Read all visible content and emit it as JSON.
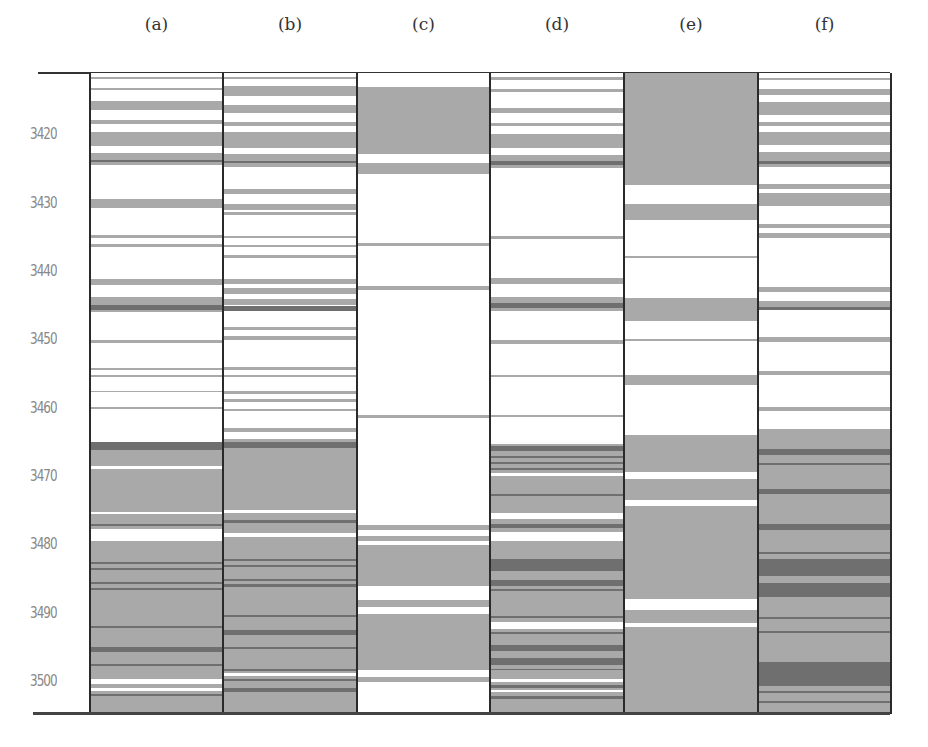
{
  "chart_data": {
    "type": "heatmap",
    "title": "",
    "xlabel": "",
    "ylabel": "",
    "y_axis": {
      "ticks": [
        3420,
        3430,
        3440,
        3450,
        3460,
        3470,
        3480,
        3490,
        3500
      ],
      "range": [
        3410.9,
        3504.5
      ],
      "inverted": true
    },
    "grid": false,
    "legend": null,
    "colors": {
      "background": "#ffffff",
      "light": "#a9a9a9",
      "dark": "#6f6f6f",
      "frame": "#2a2a2a"
    },
    "note": "Each column is a vertical strip log; bands give [top_depth, bottom_depth, tone]. Bands are drawn in order; later bands paint over earlier ones.",
    "columns": [
      {
        "label": "(a)",
        "bands": [
          [
            3411.5,
            3411.8,
            "light"
          ],
          [
            3413.1,
            3413.4,
            "light"
          ],
          [
            3415.0,
            3416.3,
            "light"
          ],
          [
            3417.8,
            3418.4,
            "light"
          ],
          [
            3419.6,
            3421.6,
            "light"
          ],
          [
            3422.6,
            3424.4,
            "light"
          ],
          [
            3423.6,
            3423.9,
            "dark"
          ],
          [
            3429.4,
            3430.6,
            "light"
          ],
          [
            3434.6,
            3435.0,
            "light"
          ],
          [
            3435.9,
            3436.3,
            "light"
          ],
          [
            3441.0,
            3441.9,
            "light"
          ],
          [
            3443.7,
            3444.8,
            "light"
          ],
          [
            3444.8,
            3445.5,
            "dark"
          ],
          [
            3445.5,
            3445.8,
            "light"
          ],
          [
            3449.9,
            3450.4,
            "light"
          ],
          [
            3454.0,
            3454.3,
            "light"
          ],
          [
            3455.1,
            3455.4,
            "light"
          ],
          [
            3457.4,
            3457.6,
            "light"
          ],
          [
            3459.8,
            3460.1,
            "light"
          ],
          [
            3464.8,
            3504.5,
            "light"
          ],
          [
            3464.8,
            3466.0,
            "dark"
          ],
          [
            3468.4,
            3468.8,
            "white"
          ],
          [
            3475.1,
            3475.4,
            "white"
          ],
          [
            3476.8,
            3477.1,
            "dark"
          ],
          [
            3477.6,
            3479.3,
            "white"
          ],
          [
            3482.4,
            3482.7,
            "dark"
          ],
          [
            3483.3,
            3483.6,
            "dark"
          ],
          [
            3485.3,
            3485.6,
            "dark"
          ],
          [
            3486.2,
            3486.5,
            "dark"
          ],
          [
            3491.8,
            3492.1,
            "dark"
          ],
          [
            3494.9,
            3495.6,
            "dark"
          ],
          [
            3497.3,
            3497.6,
            "dark"
          ],
          [
            3499.5,
            3500.2,
            "white"
          ],
          [
            3500.8,
            3501.3,
            "white"
          ],
          [
            3501.7,
            3502.0,
            "dark"
          ]
        ]
      },
      {
        "label": "(b)",
        "bands": [
          [
            3411.5,
            3411.8,
            "light"
          ],
          [
            3412.8,
            3414.3,
            "light"
          ],
          [
            3415.6,
            3416.8,
            "light"
          ],
          [
            3418.1,
            3418.6,
            "light"
          ],
          [
            3419.5,
            3421.8,
            "light"
          ],
          [
            3422.8,
            3424.6,
            "light"
          ],
          [
            3423.7,
            3424.1,
            "dark"
          ],
          [
            3427.8,
            3428.6,
            "light"
          ],
          [
            3430.0,
            3430.9,
            "light"
          ],
          [
            3431.3,
            3431.6,
            "light"
          ],
          [
            3434.7,
            3435.0,
            "light"
          ],
          [
            3436.0,
            3436.4,
            "light"
          ],
          [
            3437.5,
            3437.9,
            "light"
          ],
          [
            3441.0,
            3441.8,
            "light"
          ],
          [
            3442.3,
            3443.2,
            "light"
          ],
          [
            3443.9,
            3444.9,
            "light"
          ],
          [
            3445.0,
            3445.7,
            "dark"
          ],
          [
            3448.0,
            3448.5,
            "light"
          ],
          [
            3449.3,
            3450.0,
            "light"
          ],
          [
            3453.9,
            3454.3,
            "light"
          ],
          [
            3455.0,
            3455.4,
            "light"
          ],
          [
            3457.4,
            3457.8,
            "light"
          ],
          [
            3458.6,
            3459.0,
            "light"
          ],
          [
            3460.0,
            3460.4,
            "light"
          ],
          [
            3462.8,
            3463.4,
            "light"
          ],
          [
            3464.5,
            3504.5,
            "light"
          ],
          [
            3464.8,
            3465.7,
            "dark"
          ],
          [
            3474.8,
            3475.2,
            "white"
          ],
          [
            3476.3,
            3476.7,
            "dark"
          ],
          [
            3478.2,
            3478.7,
            "white"
          ],
          [
            3482.0,
            3482.3,
            "dark"
          ],
          [
            3482.8,
            3483.1,
            "dark"
          ],
          [
            3484.9,
            3485.2,
            "dark"
          ],
          [
            3485.6,
            3486.0,
            "dark"
          ],
          [
            3490.2,
            3490.5,
            "dark"
          ],
          [
            3492.4,
            3493.1,
            "dark"
          ],
          [
            3494.9,
            3495.2,
            "dark"
          ],
          [
            3498.0,
            3498.3,
            "dark"
          ],
          [
            3498.6,
            3499.1,
            "white"
          ],
          [
            3499.5,
            3499.8,
            "dark"
          ],
          [
            3500.8,
            3501.5,
            "dark"
          ]
        ]
      },
      {
        "label": "(c)",
        "bands": [
          [
            3413.0,
            3422.8,
            "light"
          ],
          [
            3424.0,
            3425.6,
            "light"
          ],
          [
            3435.8,
            3436.2,
            "light"
          ],
          [
            3442.0,
            3442.6,
            "light"
          ],
          [
            3460.9,
            3461.3,
            "light"
          ],
          [
            3477.0,
            3477.8,
            "light"
          ],
          [
            3478.6,
            3479.4,
            "light"
          ],
          [
            3479.9,
            3486.0,
            "light"
          ],
          [
            3488.0,
            3489.0,
            "light"
          ],
          [
            3490.0,
            3498.2,
            "light"
          ],
          [
            3499.2,
            3500.0,
            "light"
          ],
          [
            3501.0,
            3504.5,
            "white"
          ]
        ]
      },
      {
        "label": "(d)",
        "bands": [
          [
            3411.5,
            3411.9,
            "light"
          ],
          [
            3413.3,
            3413.7,
            "light"
          ],
          [
            3416.0,
            3416.8,
            "light"
          ],
          [
            3418.2,
            3418.6,
            "light"
          ],
          [
            3419.8,
            3421.9,
            "light"
          ],
          [
            3422.9,
            3424.8,
            "light"
          ],
          [
            3423.8,
            3424.3,
            "dark"
          ],
          [
            3434.8,
            3435.2,
            "light"
          ],
          [
            3440.9,
            3441.7,
            "light"
          ],
          [
            3443.7,
            3445.7,
            "light"
          ],
          [
            3444.6,
            3445.2,
            "dark"
          ],
          [
            3450.0,
            3450.6,
            "light"
          ],
          [
            3455.0,
            3455.4,
            "light"
          ],
          [
            3460.9,
            3461.2,
            "light"
          ],
          [
            3465.2,
            3504.5,
            "light"
          ],
          [
            3465.4,
            3466.2,
            "dark"
          ],
          [
            3466.9,
            3467.2,
            "dark"
          ],
          [
            3467.8,
            3468.1,
            "dark"
          ],
          [
            3468.7,
            3469.0,
            "dark"
          ],
          [
            3469.4,
            3469.8,
            "white"
          ],
          [
            3472.4,
            3472.7,
            "dark"
          ],
          [
            3475.2,
            3476.2,
            "white"
          ],
          [
            3476.9,
            3477.5,
            "dark"
          ],
          [
            3478.0,
            3479.4,
            "white"
          ],
          [
            3482.0,
            3483.8,
            "dark"
          ],
          [
            3485.0,
            3486.0,
            "dark"
          ],
          [
            3486.4,
            3486.7,
            "dark"
          ],
          [
            3490.3,
            3490.6,
            "dark"
          ],
          [
            3491.2,
            3492.2,
            "white"
          ],
          [
            3492.6,
            3492.9,
            "dark"
          ],
          [
            3494.6,
            3495.4,
            "dark"
          ],
          [
            3496.5,
            3497.5,
            "dark"
          ],
          [
            3498.0,
            3498.2,
            "dark"
          ],
          [
            3499.5,
            3500.0,
            "white"
          ],
          [
            3500.4,
            3500.8,
            "dark"
          ],
          [
            3501.1,
            3501.5,
            "white"
          ],
          [
            3502.0,
            3502.4,
            "dark"
          ]
        ]
      },
      {
        "label": "(e)",
        "bands": [
          [
            3410.9,
            3427.3,
            "light"
          ],
          [
            3430.0,
            3432.4,
            "light"
          ],
          [
            3437.6,
            3437.9,
            "light"
          ],
          [
            3443.8,
            3447.1,
            "light"
          ],
          [
            3449.8,
            3450.1,
            "light"
          ],
          [
            3455.0,
            3456.5,
            "light"
          ],
          [
            3463.8,
            3504.5,
            "light"
          ],
          [
            3469.3,
            3470.3,
            "white"
          ],
          [
            3473.4,
            3474.3,
            "white"
          ],
          [
            3487.8,
            3489.4,
            "white"
          ],
          [
            3491.4,
            3491.9,
            "white"
          ]
        ]
      },
      {
        "label": "(f)",
        "bands": [
          [
            3411.6,
            3411.9,
            "light"
          ],
          [
            3413.3,
            3414.1,
            "light"
          ],
          [
            3415.1,
            3417.1,
            "light"
          ],
          [
            3418.0,
            3418.6,
            "light"
          ],
          [
            3419.5,
            3421.5,
            "light"
          ],
          [
            3422.5,
            3424.6,
            "light"
          ],
          [
            3423.7,
            3424.2,
            "dark"
          ],
          [
            3427.2,
            3427.9,
            "light"
          ],
          [
            3428.5,
            3430.4,
            "light"
          ],
          [
            3433.0,
            3433.6,
            "light"
          ],
          [
            3434.3,
            3435.0,
            "light"
          ],
          [
            3442.2,
            3443.0,
            "light"
          ],
          [
            3444.3,
            3445.5,
            "light"
          ],
          [
            3445.1,
            3445.6,
            "dark"
          ],
          [
            3449.5,
            3450.2,
            "light"
          ],
          [
            3454.5,
            3455.0,
            "light"
          ],
          [
            3459.8,
            3460.3,
            "light"
          ],
          [
            3463.0,
            3504.5,
            "light"
          ],
          [
            3465.9,
            3466.7,
            "dark"
          ],
          [
            3467.9,
            3468.2,
            "dark"
          ],
          [
            3471.7,
            3472.4,
            "dark"
          ],
          [
            3476.9,
            3477.7,
            "dark"
          ],
          [
            3481.0,
            3481.3,
            "dark"
          ],
          [
            3482.0,
            3484.5,
            "dark"
          ],
          [
            3485.5,
            3487.5,
            "dark"
          ],
          [
            3490.4,
            3490.7,
            "dark"
          ],
          [
            3492.5,
            3492.8,
            "dark"
          ],
          [
            3497.0,
            3500.5,
            "dark"
          ],
          [
            3501.3,
            3501.6,
            "dark"
          ],
          [
            3502.7,
            3503.0,
            "dark"
          ]
        ]
      }
    ]
  }
}
